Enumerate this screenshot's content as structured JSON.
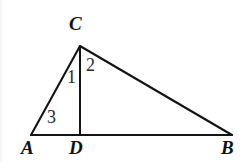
{
  "figure": {
    "kind": "geometry-diagram",
    "canvas": {
      "width": 248,
      "height": 162
    },
    "background_color": "#ffffff",
    "stroke_color": "#141414",
    "stroke_width": 2,
    "points": [
      {
        "id": "A",
        "label": "A",
        "x": 31,
        "y": 135,
        "label_x": 21,
        "label_y": 138,
        "style": "italic-serif"
      },
      {
        "id": "B",
        "label": "B",
        "x": 232,
        "y": 135,
        "label_x": 221,
        "label_y": 138,
        "style": "italic-serif"
      },
      {
        "id": "C",
        "label": "C",
        "x": 80,
        "y": 46,
        "label_x": 69,
        "label_y": 14,
        "style": "italic-serif"
      },
      {
        "id": "D",
        "label": "D",
        "x": 80,
        "y": 135,
        "label_x": 69,
        "label_y": 138,
        "style": "italic-serif"
      }
    ],
    "segments": [
      {
        "id": "AC",
        "from": "A",
        "to": "C",
        "role": "triangle-side"
      },
      {
        "id": "CB",
        "from": "C",
        "to": "B",
        "role": "triangle-side"
      },
      {
        "id": "AB",
        "from": "A",
        "to": "B",
        "role": "triangle-base"
      },
      {
        "id": "CD",
        "from": "C",
        "to": "D",
        "role": "cevian"
      }
    ],
    "angle_marks": [
      {
        "id": "1",
        "label": "1",
        "at_vertex": "C",
        "between": "CA and CD",
        "label_x": 67,
        "label_y": 68
      },
      {
        "id": "2",
        "label": "2",
        "at_vertex": "C",
        "between": "CD and CB",
        "label_x": 86,
        "label_y": 56
      },
      {
        "id": "3",
        "label": "3",
        "at_vertex": "A",
        "between": "AC and AB",
        "label_x": 47,
        "label_y": 108
      }
    ]
  }
}
